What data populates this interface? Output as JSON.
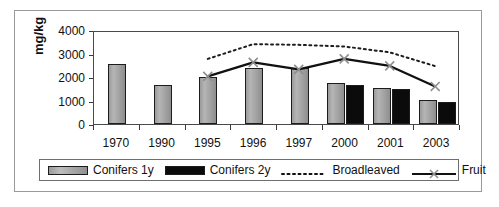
{
  "chart_data": {
    "type": "bar",
    "title": "",
    "subtitle": "",
    "xlabel": "",
    "ylabel": "mg/kg",
    "categories": [
      "1970",
      "1990",
      "1995",
      "1996",
      "1997",
      "2000",
      "2001",
      "2003"
    ],
    "ylim": [
      0,
      4000
    ],
    "yticks": [
      0,
      1000,
      2000,
      3000,
      4000
    ],
    "ytick_labels": [
      "0",
      "1000",
      "2000",
      "3000",
      "4000"
    ],
    "grid": false,
    "legend_position": "bottom",
    "series": [
      {
        "name": "Conifers 1y",
        "type": "bar",
        "color": "#a8a8a8",
        "values": [
          2550,
          1670,
          1990,
          2400,
          2400,
          1740,
          1520,
          1040
        ]
      },
      {
        "name": "Conifers 2y",
        "type": "bar",
        "color": "#0b0b0b",
        "values": [
          null,
          null,
          null,
          null,
          null,
          1640,
          1470,
          950
        ]
      },
      {
        "name": "Broadleaved",
        "type": "line",
        "style": "dotted",
        "color": "#1c1c1c",
        "values": [
          null,
          null,
          2850,
          3480,
          3450,
          3380,
          3130,
          2540
        ]
      },
      {
        "name": "Fruit",
        "type": "line",
        "style": "solid-with-x-markers",
        "color": "#111111",
        "values": [
          null,
          null,
          2100,
          2700,
          2400,
          2850,
          2550,
          1670
        ]
      }
    ]
  },
  "legend": {
    "items": [
      {
        "label": "Conifers 1y",
        "marker": "gray-bar-swatch"
      },
      {
        "label": "Conifers 2y",
        "marker": "black-bar-swatch"
      },
      {
        "label": "Broadleaved",
        "marker": "dotted-line-swatch"
      },
      {
        "label": "Fruit",
        "marker": "solid-line-x-marker-swatch"
      }
    ]
  }
}
